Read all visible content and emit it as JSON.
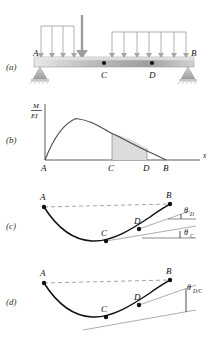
{
  "figure": {
    "colors": {
      "beam_light": "#f0f0f0",
      "beam_mid": "#b5b5b5",
      "beam_dark": "#8f8f8f",
      "load_arrow": "#a8a8a8",
      "support": "#b0b0b0",
      "curve": "#3a3a3a",
      "deflection_curve": "#111111",
      "shade": "#d9d9d9",
      "dashed": "#9a9a9a",
      "tangent": "#8a8a8a",
      "axis": "#6e6e6e"
    }
  },
  "panels": [
    {
      "key": "a",
      "label": "(a)",
      "caption": "Loaded beam with simple supports",
      "points": [
        {
          "name": "A",
          "label": "A"
        },
        {
          "name": "C",
          "label": "C"
        },
        {
          "name": "D",
          "label": "D"
        },
        {
          "name": "B",
          "label": "B"
        }
      ],
      "loads": {
        "left_distributed_arrows": 4,
        "left_concentrated_arrows": 1,
        "right_distributed_arrows": 7
      },
      "supports": [
        {
          "at": "A",
          "type": "pin"
        },
        {
          "at": "B",
          "type": "roller"
        }
      ]
    },
    {
      "key": "b",
      "label": "(b)",
      "caption": "M/EI diagram with shaded area between C and D",
      "y_axis_numerator": "M",
      "y_axis_denominator": "EI",
      "x_axis_label": "x",
      "tick_labels": [
        "A",
        "C",
        "D",
        "B"
      ],
      "shaded_region": "C to D"
    },
    {
      "key": "c",
      "label": "(c)",
      "caption": "Elastic curve with tangent slopes at C and D",
      "points": [
        {
          "name": "A",
          "label": "A"
        },
        {
          "name": "C",
          "label": "C"
        },
        {
          "name": "D",
          "label": "D"
        },
        {
          "name": "B",
          "label": "B"
        }
      ],
      "angles": [
        {
          "name": "theta-D",
          "symbol": "θ",
          "subscript": "D"
        },
        {
          "name": "theta-C",
          "symbol": "θ",
          "subscript": "C"
        }
      ]
    },
    {
      "key": "d",
      "label": "(d)",
      "caption": "Elastic curve with relative angle between tangents at D and C",
      "points": [
        {
          "name": "A",
          "label": "A"
        },
        {
          "name": "C",
          "label": "C"
        },
        {
          "name": "D",
          "label": "D"
        },
        {
          "name": "B",
          "label": "B"
        }
      ],
      "angles": [
        {
          "name": "theta-D-over-C",
          "symbol": "θ",
          "subscript": "D/C"
        }
      ]
    }
  ]
}
